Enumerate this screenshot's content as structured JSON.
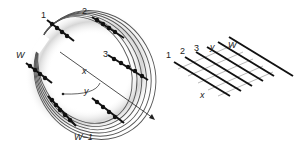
{
  "figure": {
    "rolled_lattice": {
      "labels": {
        "row1": "1",
        "row2": "2",
        "row3": "3",
        "rowW": "W",
        "rowWm1": "W−1",
        "axis_x": "x",
        "axis_y": "y"
      },
      "ring_count": 6,
      "ring_color": "#555555",
      "halo_color": "#d9d9d9",
      "chain_color": "#111111"
    },
    "flat_lattice": {
      "labels": {
        "col1": "1",
        "col2": "2",
        "col3": "3",
        "coly": "y",
        "colW": "W",
        "axis_x": "x"
      },
      "line_count": 6,
      "line_color": "#111111",
      "cross_color": "#888888"
    }
  }
}
